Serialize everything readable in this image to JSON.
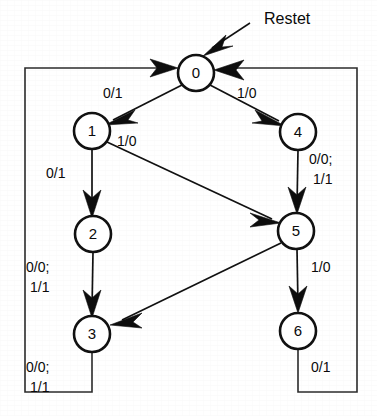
{
  "diagram": {
    "type": "finite-state-machine",
    "title_label": "Restet",
    "reset_arrow_name": "reset-input-arrow",
    "states": [
      {
        "id": "0",
        "label": "0",
        "cx": 196,
        "cy": 73,
        "r": 18
      },
      {
        "id": "1",
        "label": "1",
        "cx": 92,
        "cy": 131,
        "r": 18
      },
      {
        "id": "4",
        "label": "4",
        "cx": 298,
        "cy": 132,
        "r": 18
      },
      {
        "id": "2",
        "label": "2",
        "cx": 93,
        "cy": 234,
        "r": 18
      },
      {
        "id": "5",
        "label": "5",
        "cx": 296,
        "cy": 231,
        "r": 18
      },
      {
        "id": "3",
        "label": "3",
        "cx": 92,
        "cy": 334,
        "r": 18
      },
      {
        "id": "6",
        "label": "6",
        "cx": 298,
        "cy": 331,
        "r": 18
      }
    ],
    "transitions": [
      {
        "from": "0",
        "to": "1",
        "label": "0/1",
        "label_lines": [
          "0/1"
        ],
        "lx": 103,
        "ly": 98
      },
      {
        "from": "0",
        "to": "4",
        "label": "1/0",
        "label_lines": [
          "1/0"
        ],
        "lx": 237,
        "ly": 98
      },
      {
        "from": "1",
        "to": "5",
        "label": "1/0",
        "label_lines": [
          "1/0"
        ],
        "lx": 117,
        "ly": 146
      },
      {
        "from": "1",
        "to": "2",
        "label": "0/1",
        "label_lines": [
          "0/1"
        ],
        "lx": 46,
        "ly": 178
      },
      {
        "from": "4",
        "to": "5",
        "label": "0/0; 1/1",
        "label_lines": [
          "0/0;",
          "1/1"
        ],
        "lx": 309,
        "ly": 164
      },
      {
        "from": "2",
        "to": "3",
        "label": "0/0; 1/1",
        "label_lines": [
          "0/0;",
          "1/1"
        ],
        "lx": 26,
        "ly": 272
      },
      {
        "from": "5",
        "to": "3",
        "label": "",
        "label_lines": [],
        "lx": 0,
        "ly": 0
      },
      {
        "from": "5",
        "to": "6",
        "label": "1/0",
        "label_lines": [
          "1/0"
        ],
        "lx": 311,
        "ly": 272
      },
      {
        "from": "3",
        "to": "0",
        "label": "0/0; 1/1",
        "label_lines": [
          "0/0;",
          "1/1"
        ],
        "lx": 26,
        "ly": 372
      },
      {
        "from": "6",
        "to": "0",
        "label": "0/1",
        "label_lines": [
          "0/1"
        ],
        "lx": 311,
        "ly": 372
      }
    ],
    "frame": {
      "left": 25,
      "right": 357,
      "top": 68,
      "bottom": 392
    }
  }
}
